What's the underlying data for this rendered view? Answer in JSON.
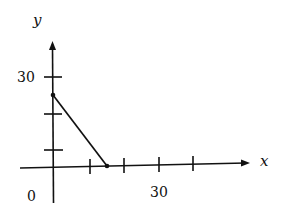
{
  "figure": {
    "axes": {
      "x_label": "x",
      "y_label": "y",
      "origin_label": "0",
      "x_tick_label": "30",
      "y_tick_label": "30"
    },
    "line_segment": {
      "start": {
        "x": 0,
        "y": 24
      },
      "end": {
        "x": 15,
        "y": 0
      }
    },
    "colors": {
      "ink": "#111111",
      "background": "#ffffff"
    }
  }
}
